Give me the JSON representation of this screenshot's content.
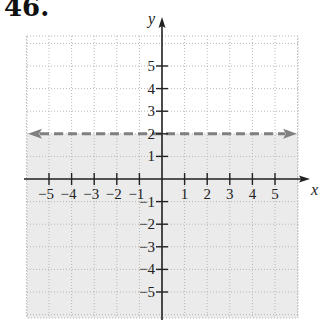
{
  "problem": {
    "number": "46."
  },
  "colors": {
    "shade": "#ebebeb",
    "grid": "#b8b8b8",
    "axis": "#222222",
    "boundary_line": "#808080"
  },
  "chart_data": {
    "type": "area",
    "title": "46.",
    "inequality": "y < 2",
    "boundary": {
      "equation": "y = 2",
      "style": "dashed",
      "arrows": "both"
    },
    "shaded_region": "below",
    "xlabel": "x",
    "ylabel": "y",
    "xlim": [
      -6,
      6
    ],
    "ylim": [
      -6,
      6
    ],
    "x_ticks": [
      -5,
      -4,
      -3,
      -2,
      -1,
      1,
      2,
      3,
      4,
      5
    ],
    "y_ticks": [
      -5,
      -4,
      -3,
      -2,
      -1,
      1,
      2,
      3,
      4,
      5
    ],
    "x_tick_labels": [
      "−5",
      "−4",
      "−3",
      "−2",
      "−1",
      "1",
      "2",
      "3",
      "4",
      "5"
    ],
    "y_tick_labels": [
      "−5",
      "−4",
      "−3",
      "−2",
      "−1",
      "1",
      "2",
      "3",
      "4",
      "5"
    ],
    "grid": true,
    "grid_style": "dotted"
  }
}
